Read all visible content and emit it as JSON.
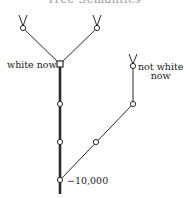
{
  "title": "Tree Semantics",
  "labels": {
    "white_now": "white now",
    "not_white_now_line1": "not white",
    "not_white_now_line2": "now",
    "time_marker": "−10,000"
  },
  "colors": {
    "line": "#2a2a2a",
    "background": "#ffffff"
  },
  "nodes": [
    {
      "id": "leaf-left",
      "shape": "circle"
    },
    {
      "id": "leaf-right",
      "shape": "circle"
    },
    {
      "id": "branch-now",
      "shape": "square"
    },
    {
      "id": "trunk-1",
      "shape": "circle"
    },
    {
      "id": "trunk-2",
      "shape": "circle"
    },
    {
      "id": "trunk-origin",
      "shape": "circle"
    },
    {
      "id": "alt-mid",
      "shape": "circle"
    },
    {
      "id": "alt-upper",
      "shape": "circle"
    },
    {
      "id": "alt-leaf",
      "shape": "circle"
    }
  ]
}
